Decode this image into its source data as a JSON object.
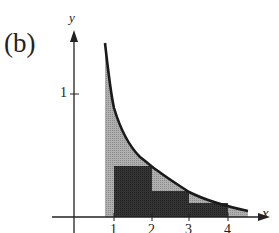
{
  "figure": {
    "panel_label": "(b)",
    "x_axis_label": "x",
    "y_axis_label": "y",
    "x_ticks": [
      "1",
      "2",
      "3",
      "4"
    ],
    "y_ticks": [
      "1"
    ],
    "colors": {
      "curve": "#1a1a1a",
      "light_shade": "#a8a8a8",
      "dark_shade": "#2e2e2e",
      "axis": "#222222"
    }
  }
}
